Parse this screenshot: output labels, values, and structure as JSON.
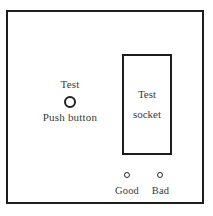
{
  "diagram": {
    "panel": {
      "border_color": "#1d1d1d",
      "background_color": "#ffffff"
    },
    "push_button_group": {
      "top_label": "Test",
      "bottom_label": "Push button"
    },
    "test_socket": {
      "line1": "Test",
      "line2": "socket"
    },
    "indicators": [
      {
        "label": "Good"
      },
      {
        "label": "Bad"
      }
    ]
  }
}
